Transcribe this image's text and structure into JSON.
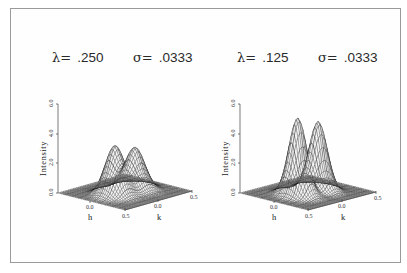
{
  "chart_data": [
    {
      "type": "surface3d",
      "title": "λ = .250   σ = .0333",
      "params": {
        "lambda": ".250",
        "sigma": ".0333"
      },
      "xlabel": "h",
      "ylabel": "k",
      "zlabel": "Intensity",
      "x_ticks": [
        "0.0",
        "0.5"
      ],
      "y_ticks": [
        "0.0",
        "0.5"
      ],
      "z_ticks": [
        "0.0",
        "2.0",
        "4.0",
        "6.0"
      ],
      "xlim": [
        -0.5,
        0.5
      ],
      "ylim": [
        -0.5,
        0.5
      ],
      "zlim": [
        0.0,
        6.0
      ],
      "peaks": [
        {
          "h": 0.0,
          "k": -0.15,
          "height": 3.3
        },
        {
          "h": 0.0,
          "k": 0.15,
          "height": 2.8
        }
      ],
      "description": "Wireframe surface with two rounded peaks separated by a valley along h≈0"
    },
    {
      "type": "surface3d",
      "title": "λ = .125   σ = .0333",
      "params": {
        "lambda": ".125",
        "sigma": ".0333"
      },
      "xlabel": "h",
      "ylabel": "k",
      "zlabel": "Intensity",
      "x_ticks": [
        "0.0",
        "0.5"
      ],
      "y_ticks": [
        "0.0",
        "0.5"
      ],
      "z_ticks": [
        "0.0",
        "2.0",
        "4.0",
        "6.0"
      ],
      "xlim": [
        -0.5,
        0.5
      ],
      "ylim": [
        -0.5,
        0.5
      ],
      "zlim": [
        0.0,
        6.0
      ],
      "peaks": [
        {
          "h": 0.0,
          "k": -0.15,
          "height": 5.2
        },
        {
          "h": 0.0,
          "k": 0.15,
          "height": 4.6
        }
      ],
      "description": "Wireframe surface with two taller, narrower peaks separated by a valley along h≈0"
    }
  ],
  "panels": [
    {
      "lambda_symbol": "λ=",
      "lambda_value": ".250",
      "sigma_symbol": "σ=",
      "sigma_value": ".0333",
      "zlabel": "Intensity",
      "z_ticks": [
        "0.0",
        "2.0",
        "4.0",
        "6.0"
      ],
      "h_label": "h",
      "k_label": "k",
      "h_ticks": [
        "0.0",
        "0.5"
      ],
      "k_ticks": [
        "0.0",
        "0.5"
      ]
    },
    {
      "lambda_symbol": "λ=",
      "lambda_value": ".125",
      "sigma_symbol": "σ=",
      "sigma_value": ".0333",
      "zlabel": "Intensity",
      "z_ticks": [
        "0.0",
        "2.0",
        "4.0",
        "6.0"
      ],
      "h_label": "h",
      "k_label": "k",
      "h_ticks": [
        "0.0",
        "0.5"
      ],
      "k_ticks": [
        "0.0",
        "0.5"
      ]
    }
  ]
}
